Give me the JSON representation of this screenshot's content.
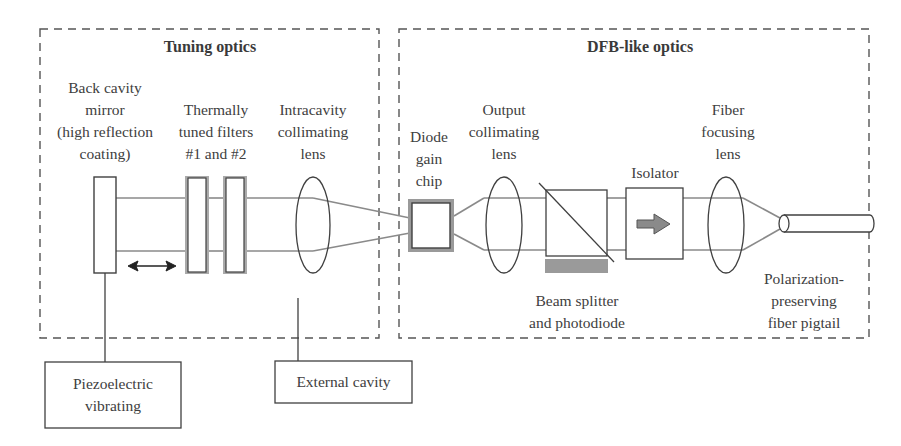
{
  "groups": {
    "tuning": {
      "title": "Tuning optics"
    },
    "dfb": {
      "title": "DFB-like optics"
    }
  },
  "components": {
    "back_mirror": "Back cavity\nmirror\n(high reflection\ncoating)",
    "filters": "Thermally\ntuned filters\n#1 and #2",
    "intracavity_lens": "Intracavity\ncollimating\nlens",
    "gain_chip": "Diode\ngain\nchip",
    "output_lens": "Output\ncollimating\nlens",
    "isolator": "Isolator",
    "fiber_lens": "Fiber\nfocusing\nlens",
    "beam_splitter": "Beam splitter\nand photodiode",
    "fiber_pigtail": "Polarization-\npreserving\nfiber pigtail"
  },
  "callouts": {
    "piezo": "Piezoelectric\nvibrating",
    "external_cavity": "External cavity"
  },
  "colors": {
    "line": "#404040",
    "beam": "#8a8a8a",
    "fill_gray": "#9a9a9a",
    "dash": "#555555"
  }
}
